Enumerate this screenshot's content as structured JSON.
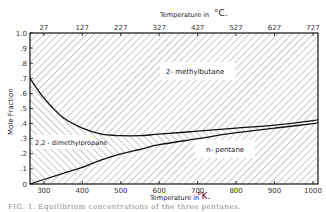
{
  "chart_data": {
    "type": "area",
    "title": "",
    "xlabel": "Temperature in °K.",
    "x2label": "Temperature in °C.",
    "ylabel": "Mole Fraction",
    "xlim": [
      264,
      1013
    ],
    "ylim": [
      0,
      1.0
    ],
    "x_ticks": [
      300,
      400,
      500,
      600,
      700,
      800,
      900,
      1000
    ],
    "x_tick_labels": [
      "300",
      "400",
      "500",
      "600",
      "700",
      "800",
      "900",
      "1000"
    ],
    "x2_ticks": [
      27,
      127,
      227,
      327,
      427,
      527,
      627,
      727
    ],
    "x2_tick_labels": [
      "27",
      "127",
      "227",
      "327",
      "427",
      "527",
      "627",
      "727"
    ],
    "y_ticks": [
      0,
      0.1,
      0.2,
      0.3,
      0.4,
      0.5,
      0.6,
      0.7,
      0.8,
      0.9,
      1.0
    ],
    "y_tick_labels": [
      "0",
      ".1",
      ".2",
      ".3",
      ".4",
      ".5",
      ".6",
      ".7",
      ".8",
      ".9",
      "1.0"
    ],
    "grid": false,
    "x": [
      264,
      300,
      350,
      400,
      450,
      500,
      550,
      600,
      700,
      800,
      900,
      1000,
      1013
    ],
    "series": [
      {
        "name": "n-pentane",
        "values": [
          0.0,
          0.03,
          0.07,
          0.11,
          0.16,
          0.2,
          0.23,
          0.26,
          0.3,
          0.34,
          0.37,
          0.4,
          0.41
        ]
      },
      {
        "name": "2,2-dimethylpropane",
        "values": [
          0.7,
          0.57,
          0.44,
          0.37,
          0.33,
          0.32,
          0.32,
          0.33,
          0.35,
          0.37,
          0.39,
          0.42,
          0.43
        ]
      },
      {
        "name": "2-methylbutane",
        "values": [
          0.3,
          0.4,
          0.49,
          0.52,
          0.51,
          0.48,
          0.45,
          0.41,
          0.35,
          0.29,
          0.24,
          0.18,
          0.16
        ]
      }
    ],
    "boundaries": {
      "lower_curve_cumulative": [
        0.0,
        0.03,
        0.07,
        0.11,
        0.16,
        0.2,
        0.23,
        0.26,
        0.3,
        0.34,
        0.37,
        0.4,
        0.41
      ],
      "upper_curve_cumulative": [
        0.7,
        0.6,
        0.51,
        0.48,
        0.49,
        0.52,
        0.55,
        0.59,
        0.65,
        0.71,
        0.76,
        0.82,
        0.84
      ]
    },
    "region_labels": [
      "2- methylbutane",
      "2,2 - dimethylpropane",
      "n- pentane"
    ],
    "legend": "none (regions labeled directly)"
  },
  "labels": {
    "x_axis": "Temperature in",
    "x_unit": "°K.",
    "x2_axis": "Temperature in",
    "x2_unit": "°C.",
    "y_axis": "Mole Fraction",
    "region_top": "2- methylbutane",
    "region_middle": "2,2 - dimethylpropane",
    "region_bottom": "n- pentane"
  },
  "caption": "FIG. 1. Equilibrium concentrations of the three pentanes."
}
